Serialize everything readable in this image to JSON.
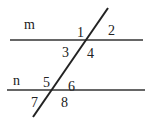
{
  "diagram": {
    "lines": {
      "m": {
        "label": "m"
      },
      "n": {
        "label": "n"
      },
      "transversal": {}
    },
    "angles": [
      "1",
      "2",
      "3",
      "4",
      "5",
      "6",
      "7",
      "8"
    ],
    "colors": {
      "stroke": "#333333",
      "text": "#222222",
      "background": "#ffffff"
    }
  }
}
